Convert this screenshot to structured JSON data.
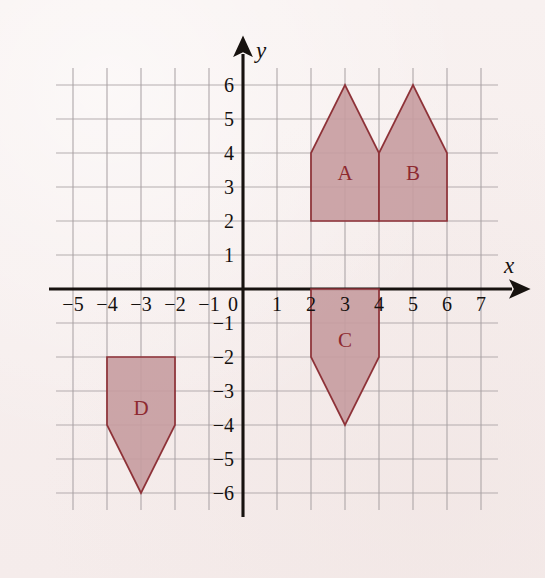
{
  "figure": {
    "title": "",
    "background_color": "#f7efee",
    "grid_color": "#a9a2a4",
    "axis_color": "#17120f",
    "shape_fill": "#c79ca0",
    "shape_stroke": "#8e3238",
    "label_color": "#8e2a30"
  },
  "chart_data": {
    "type": "scatter",
    "title": "",
    "xlabel": "x",
    "ylabel": "y",
    "grid": true,
    "legend_position": "none",
    "xlim": [
      -5.5,
      7.5
    ],
    "ylim": [
      -6.5,
      6.5
    ],
    "x_ticks": [
      -5,
      -4,
      -3,
      -2,
      -1,
      0,
      1,
      2,
      3,
      4,
      5,
      6,
      7
    ],
    "y_ticks": [
      6,
      5,
      4,
      3,
      2,
      1,
      -1,
      -2,
      -3,
      -4,
      -5,
      -6
    ],
    "x_tick_labels": [
      "−5",
      "−4",
      "−3",
      "−2",
      "−1",
      "0",
      "1",
      "2",
      "3",
      "4",
      "5",
      "6",
      "7"
    ],
    "y_tick_labels": [
      "6",
      "5",
      "4",
      "3",
      "2",
      "1",
      "−1",
      "−2",
      "−3",
      "−4",
      "−5",
      "−6"
    ],
    "origin_label": "0",
    "shapes": [
      {
        "name": "A",
        "label": "A",
        "label_position": [
          3,
          3.4
        ],
        "description": "house pentagon pointing up",
        "vertices": [
          [
            2,
            2
          ],
          [
            4,
            2
          ],
          [
            4,
            4
          ],
          [
            3,
            6
          ],
          [
            2,
            4
          ]
        ]
      },
      {
        "name": "B",
        "label": "B",
        "label_position": [
          5,
          3.4
        ],
        "description": "house pentagon pointing up",
        "vertices": [
          [
            4,
            2
          ],
          [
            6,
            2
          ],
          [
            6,
            4
          ],
          [
            5,
            6
          ],
          [
            4,
            4
          ]
        ]
      },
      {
        "name": "C",
        "label": "C",
        "label_position": [
          3,
          -1.5
        ],
        "description": "house pentagon pointing down",
        "vertices": [
          [
            2,
            0
          ],
          [
            4,
            0
          ],
          [
            4,
            -2
          ],
          [
            3,
            -4
          ],
          [
            2,
            -2
          ]
        ]
      },
      {
        "name": "D",
        "label": "D",
        "label_position": [
          -3,
          -3.5
        ],
        "description": "house pentagon pointing down",
        "vertices": [
          [
            -4,
            -2
          ],
          [
            -2,
            -2
          ],
          [
            -2,
            -4
          ],
          [
            -3,
            -6
          ],
          [
            -4,
            -4
          ]
        ]
      }
    ]
  },
  "axis_labels": {
    "x": "x",
    "y": "y"
  }
}
